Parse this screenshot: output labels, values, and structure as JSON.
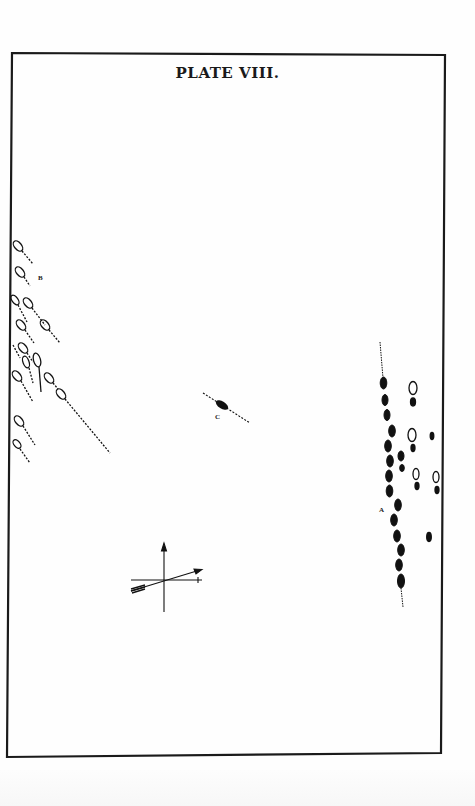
{
  "plate": {
    "title": "PLATE VIII.",
    "frame_color": "#1a1a1a",
    "ink_color": "#111111"
  },
  "figures": {
    "B": {
      "label": "B",
      "description": "cluster of open oval drop shapes with dashed tails slanting down-right along left border"
    },
    "C": {
      "label": "C",
      "description": "single solid spindle shape on dashed diagonal line"
    },
    "A": {
      "label": "A",
      "description": "vertical column of solid drops with dashed axis, plus open ovals with solid dots to the right"
    },
    "axes": {
      "description": "cross of vertical and horizontal axes with slanted arrow",
      "icons": [
        "arrow-up-icon",
        "arrow-right-icon",
        "feathered-arrow-icon"
      ]
    }
  }
}
